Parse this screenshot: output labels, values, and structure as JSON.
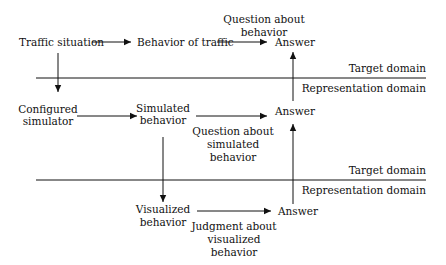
{
  "diagram": {
    "colors": {
      "ink": "#111111",
      "background": "#ffffff"
    },
    "level1": {
      "source": "Traffic situation",
      "behavior": "Behavior of traffic",
      "question": [
        "Question about",
        "behavior"
      ],
      "answer": "Answer"
    },
    "divider1": {
      "above": "Target domain",
      "below": "Representation domain"
    },
    "level2": {
      "source": [
        "Configured",
        "simulator"
      ],
      "behavior": [
        "Simulated",
        "behavior"
      ],
      "question": [
        "Question about",
        "simulated",
        "behavior"
      ],
      "answer": "Answer"
    },
    "divider2": {
      "above": "Target domain",
      "below": "Representation domain"
    },
    "level3": {
      "behavior": [
        "Visualized",
        "behavior"
      ],
      "question": [
        "Judgment about",
        "visualized",
        "behavior"
      ],
      "answer": "Answer"
    }
  }
}
